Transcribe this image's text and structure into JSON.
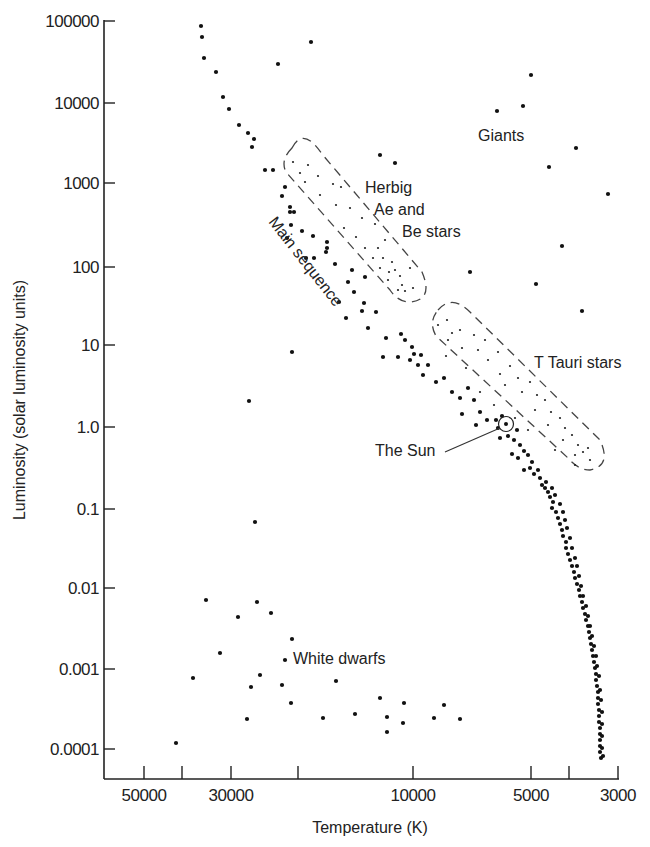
{
  "chart_data": {
    "type": "scatter",
    "title": "",
    "xlabel": "Temperature (K)",
    "ylabel": "Luminosity (solar luminosity units)",
    "x_scale": "log (reversed)",
    "y_scale": "log",
    "xlim": [
      60000,
      3000
    ],
    "ylim": [
      5e-05,
      100000
    ],
    "grid": false,
    "legend": "none",
    "x_ticks": [
      {
        "value": 50000,
        "label": "50000",
        "px": 144
      },
      {
        "value": 40000,
        "label": "",
        "px": 182
      },
      {
        "value": 30000,
        "label": "30000",
        "px": 231
      },
      {
        "value": 20000,
        "label": "",
        "px": 298
      },
      {
        "value": 10000,
        "label": "10000",
        "px": 413
      },
      {
        "value": 5000,
        "label": "5000",
        "px": 531
      },
      {
        "value": 4000,
        "label": "",
        "px": 569
      },
      {
        "value": 3000,
        "label": "3000",
        "px": 618
      }
    ],
    "y_ticks": [
      {
        "value": 100000,
        "label": "100000",
        "px": 21
      },
      {
        "value": 10000,
        "label": "10000",
        "px": 103
      },
      {
        "value": 1000,
        "label": "1000",
        "px": 183
      },
      {
        "value": 100,
        "label": "100",
        "px": 267
      },
      {
        "value": 10,
        "label": "10",
        "px": 345
      },
      {
        "value": 1.0,
        "label": "1.0",
        "px": 427
      },
      {
        "value": 0.1,
        "label": "0.1",
        "px": 509
      },
      {
        "value": 0.01,
        "label": "0.01",
        "px": 588
      },
      {
        "value": 0.001,
        "label": "0.001",
        "px": 669
      },
      {
        "value": 0.0001,
        "label": "0.0001",
        "px": 749
      }
    ],
    "annotations": [
      {
        "id": "giants",
        "text": "Giants",
        "x": 478,
        "y": 140
      },
      {
        "id": "herbig",
        "lines": [
          "Herbig",
          "Ae and",
          "Be stars"
        ],
        "x": 366,
        "y": 192
      },
      {
        "id": "main-sequence",
        "text": "Main sequence",
        "x": 270,
        "y": 222,
        "rotate": 52
      },
      {
        "id": "t-tauri",
        "text": "T Tauri stars",
        "x": 535,
        "y": 367
      },
      {
        "id": "sun",
        "text": "The Sun",
        "x": 376,
        "y": 456
      },
      {
        "id": "white-dwarfs",
        "text": "White dwarfs",
        "x": 294,
        "y": 664
      }
    ],
    "sun": {
      "px": [
        506,
        424
      ],
      "T": 5800,
      "L": 1.0
    },
    "regions": [
      {
        "name": "Herbig Ae and Be stars",
        "path": "M 292 148 Q 303 126 322 154 L 422 272 Q 434 300 410 302 Q 398 302 390 290 L 286 172 Q 280 160 292 148 Z"
      },
      {
        "name": "T Tauri stars",
        "path": "M 438 310 Q 452 294 470 312 L 600 440 Q 612 466 590 470 Q 578 470 568 458 L 436 336 Q 428 322 438 310 Z"
      }
    ],
    "series": [
      {
        "name": "Main sequence",
        "points_px": [
          [
            201,
            26
          ],
          [
            202,
            37
          ],
          [
            204,
            58
          ],
          [
            216,
            72
          ],
          [
            223,
            97
          ],
          [
            229,
            109
          ],
          [
            239,
            125
          ],
          [
            248,
            133
          ],
          [
            254,
            139
          ],
          [
            252,
            147
          ],
          [
            265,
            170
          ],
          [
            273,
            170
          ],
          [
            285,
            187
          ],
          [
            282,
            196
          ],
          [
            290,
            207
          ],
          [
            294,
            212
          ],
          [
            290,
            212
          ],
          [
            302,
            231
          ],
          [
            287,
            238
          ],
          [
            291,
            225
          ],
          [
            313,
            236
          ],
          [
            314,
            258
          ],
          [
            306,
            258
          ],
          [
            327,
            242
          ],
          [
            327,
            248
          ],
          [
            326,
            252
          ],
          [
            335,
            264
          ],
          [
            352,
            270
          ],
          [
            348,
            282
          ],
          [
            365,
            277
          ],
          [
            354,
            292
          ],
          [
            339,
            302
          ],
          [
            364,
            303
          ],
          [
            362,
            311
          ],
          [
            346,
            318
          ],
          [
            368,
            328
          ],
          [
            376,
            312
          ],
          [
            386,
            338
          ],
          [
            401,
            334
          ],
          [
            405,
            340
          ],
          [
            383,
            357
          ],
          [
            398,
            357
          ],
          [
            412,
            347
          ],
          [
            414,
            354
          ],
          [
            410,
            360
          ],
          [
            421,
            355
          ],
          [
            418,
            365
          ],
          [
            428,
            365
          ],
          [
            423,
            375
          ],
          [
            436,
            382
          ],
          [
            444,
            378
          ],
          [
            452,
            392
          ],
          [
            460,
            398
          ],
          [
            468,
            388
          ],
          [
            474,
            400
          ],
          [
            462,
            414
          ],
          [
            480,
            412
          ],
          [
            487,
            420
          ],
          [
            476,
            425
          ],
          [
            496,
            420
          ],
          [
            502,
            416
          ],
          [
            498,
            428
          ],
          [
            508,
            436
          ],
          [
            500,
            438
          ],
          [
            517,
            430
          ],
          [
            514,
            440
          ],
          [
            520,
            445
          ],
          [
            524,
            451
          ],
          [
            512,
            454
          ],
          [
            518,
            458
          ],
          [
            528,
            455
          ],
          [
            532,
            462
          ],
          [
            530,
            468
          ],
          [
            524,
            470
          ],
          [
            534,
            474
          ],
          [
            538,
            470
          ],
          [
            540,
            478
          ],
          [
            542,
            485
          ],
          [
            545,
            488
          ],
          [
            548,
            492
          ],
          [
            550,
            497
          ],
          [
            553,
            502
          ],
          [
            552,
            508
          ],
          [
            556,
            512
          ],
          [
            558,
            518
          ],
          [
            560,
            524
          ],
          [
            562,
            530
          ],
          [
            563,
            536
          ],
          [
            566,
            542
          ],
          [
            566,
            548
          ],
          [
            568,
            554
          ],
          [
            570,
            560
          ],
          [
            572,
            566
          ],
          [
            574,
            572
          ],
          [
            575,
            578
          ],
          [
            577,
            584
          ],
          [
            579,
            590
          ],
          [
            580,
            596
          ],
          [
            582,
            602
          ],
          [
            583,
            608
          ],
          [
            585,
            614
          ],
          [
            586,
            620
          ],
          [
            588,
            626
          ],
          [
            589,
            632
          ],
          [
            590,
            638
          ],
          [
            591,
            644
          ],
          [
            592,
            650
          ],
          [
            593,
            656
          ],
          [
            594,
            662
          ],
          [
            595,
            668
          ],
          [
            596,
            674
          ],
          [
            596,
            680
          ],
          [
            597,
            686
          ],
          [
            598,
            692
          ],
          [
            598,
            698
          ],
          [
            598,
            704
          ],
          [
            599,
            710
          ],
          [
            599,
            716
          ],
          [
            599,
            722
          ],
          [
            600,
            728
          ],
          [
            600,
            734
          ],
          [
            600,
            740
          ],
          [
            600,
            746
          ],
          [
            600,
            752
          ],
          [
            601,
            758
          ],
          [
            546,
            482
          ],
          [
            552,
            488
          ],
          [
            555,
            495
          ],
          [
            560,
            504
          ],
          [
            563,
            512
          ],
          [
            565,
            520
          ],
          [
            567,
            528
          ],
          [
            570,
            538
          ],
          [
            572,
            548
          ],
          [
            575,
            558
          ],
          [
            577,
            566
          ],
          [
            579,
            576
          ],
          [
            581,
            586
          ],
          [
            583,
            596
          ],
          [
            586,
            606
          ],
          [
            588,
            616
          ],
          [
            590,
            626
          ],
          [
            592,
            636
          ],
          [
            594,
            646
          ],
          [
            596,
            656
          ],
          [
            597,
            666
          ],
          [
            599,
            676
          ],
          [
            600,
            690
          ],
          [
            601,
            700
          ],
          [
            602,
            712
          ],
          [
            602,
            724
          ],
          [
            602,
            736
          ],
          [
            602,
            748
          ],
          [
            603,
            756
          ]
        ]
      },
      {
        "name": "Giants",
        "points_px": [
          [
            311,
            42
          ],
          [
            278,
            64
          ],
          [
            531,
            75
          ],
          [
            497,
            111
          ],
          [
            523,
            106
          ],
          [
            576,
            148
          ],
          [
            549,
            167
          ],
          [
            608,
            194
          ],
          [
            562,
            246
          ],
          [
            536,
            284
          ],
          [
            470,
            272
          ],
          [
            582,
            311
          ],
          [
            380,
            155
          ],
          [
            395,
            163
          ]
        ]
      },
      {
        "name": "Isolated",
        "points_px": [
          [
            292,
            352
          ],
          [
            249,
            401
          ],
          [
            255,
            522
          ]
        ]
      },
      {
        "name": "White dwarfs",
        "points_px": [
          [
            206,
            600
          ],
          [
            238,
            617
          ],
          [
            257,
            602
          ],
          [
            271,
            613
          ],
          [
            292,
            639
          ],
          [
            220,
            653
          ],
          [
            285,
            660
          ],
          [
            193,
            678
          ],
          [
            260,
            675
          ],
          [
            251,
            687
          ],
          [
            282,
            685
          ],
          [
            291,
            703
          ],
          [
            336,
            681
          ],
          [
            247,
            719
          ],
          [
            323,
            718
          ],
          [
            355,
            714
          ],
          [
            380,
            698
          ],
          [
            404,
            703
          ],
          [
            387,
            717
          ],
          [
            387,
            732
          ],
          [
            403,
            723
          ],
          [
            434,
            718
          ],
          [
            444,
            705
          ],
          [
            460,
            719
          ],
          [
            176,
            743
          ]
        ]
      },
      {
        "name": "Herbig Ae/Be (pre-main-sequence)",
        "small": true,
        "points_px": [
          [
            293,
            162
          ],
          [
            308,
            165
          ],
          [
            300,
            173
          ],
          [
            318,
            176
          ],
          [
            305,
            182
          ],
          [
            320,
            195
          ],
          [
            333,
            184
          ],
          [
            341,
            187
          ],
          [
            336,
            205
          ],
          [
            350,
            208
          ],
          [
            362,
            218
          ],
          [
            356,
            237
          ],
          [
            344,
            228
          ],
          [
            375,
            224
          ],
          [
            378,
            248
          ],
          [
            365,
            248
          ],
          [
            385,
            240
          ],
          [
            392,
            262
          ],
          [
            373,
            258
          ],
          [
            380,
            268
          ],
          [
            395,
            270
          ],
          [
            400,
            276
          ],
          [
            388,
            280
          ],
          [
            402,
            285
          ],
          [
            410,
            268
          ],
          [
            413,
            288
          ],
          [
            405,
            291
          ],
          [
            398,
            290
          ],
          [
            389,
            272
          ],
          [
            383,
            258
          ]
        ]
      },
      {
        "name": "T Tauri (pre-main-sequence)",
        "small": true,
        "points_px": [
          [
            438,
            325
          ],
          [
            447,
            320
          ],
          [
            452,
            333
          ],
          [
            448,
            340
          ],
          [
            460,
            330
          ],
          [
            462,
            348
          ],
          [
            474,
            335
          ],
          [
            478,
            350
          ],
          [
            485,
            340
          ],
          [
            488,
            360
          ],
          [
            498,
            352
          ],
          [
            500,
            374
          ],
          [
            510,
            366
          ],
          [
            505,
            385
          ],
          [
            518,
            378
          ],
          [
            522,
            392
          ],
          [
            530,
            382
          ],
          [
            537,
            395
          ],
          [
            535,
            410
          ],
          [
            545,
            400
          ],
          [
            551,
            412
          ],
          [
            548,
            425
          ],
          [
            560,
            418
          ],
          [
            565,
            428
          ],
          [
            563,
            440
          ],
          [
            572,
            435
          ],
          [
            578,
            445
          ],
          [
            583,
            452
          ],
          [
            575,
            455
          ],
          [
            588,
            448
          ],
          [
            446,
            356
          ],
          [
            466,
            368
          ],
          [
            480,
            392
          ],
          [
            494,
            405
          ],
          [
            515,
            418
          ],
          [
            528,
            430
          ],
          [
            555,
            450
          ],
          [
            575,
            465
          ],
          [
            590,
            460
          ]
        ]
      }
    ]
  }
}
